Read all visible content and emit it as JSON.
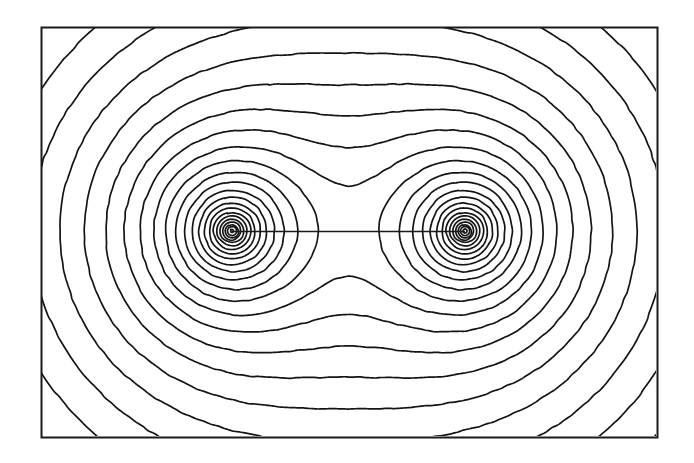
{
  "figure": {
    "domain": "Chart",
    "title": "",
    "caption": "",
    "background_color": "#ffffff",
    "width": 694,
    "height": 463
  },
  "frame": {
    "name": "plot-border",
    "x": 41,
    "y": 27,
    "width": 616,
    "height": 410,
    "stroke_color": "#1a1a1a",
    "stroke_width": 2.0,
    "fill_color": "#ffffff"
  },
  "axis_line": {
    "name": "charge-axis-line",
    "visible": true,
    "y": 231,
    "x_start": 232,
    "x_end": 465,
    "stroke_color": "#1a1a1a",
    "stroke_width": 1.6
  },
  "charges": [
    {
      "label": "left-charge",
      "x": 232,
      "y": 231,
      "sign": 1,
      "magnitude": 1.0
    },
    {
      "label": "right-charge",
      "x": 465,
      "y": 231,
      "sign": 1,
      "magnitude": 1.0
    }
  ],
  "contour_style": {
    "stroke_color": "#141414",
    "stroke_width": 1.7,
    "line_join": "round",
    "line_cap": "round",
    "jitter_amplitude": 0.55,
    "jitter_frequency": 0.13
  },
  "chart_data": {
    "type": "contour",
    "title": "Equipotential lines of two equal like point charges",
    "subtitle": "",
    "xlabel": "",
    "ylabel": "",
    "xlim": [
      41,
      657
    ],
    "ylim": [
      27,
      437
    ],
    "grid": false,
    "legend": "none",
    "axis_ticks": [],
    "tick_labels": [],
    "annotations": [],
    "field": {
      "formula": "V(x,y) = q1 / r1 + q2 / r2",
      "softening": 3.2,
      "sample_step": 1.25,
      "sources": [
        {
          "x": 232,
          "y": 231,
          "q": 1.0
        },
        {
          "x": 465,
          "y": 231,
          "q": 1.0
        }
      ]
    },
    "levels": [
      0.00505,
      0.0057,
      0.00645,
      0.0073,
      0.00828,
      0.0094,
      0.0107,
      0.0122,
      0.01395,
      0.016,
      0.0184,
      0.02125,
      0.02465,
      0.02875,
      0.03375,
      0.0399,
      0.0476,
      0.0574,
      0.0701,
      0.087,
      0.1103,
      0.1435,
      0.194,
      0.276,
      0.425,
      0.75
    ],
    "level_count": 26,
    "level_spacing": "geometric"
  },
  "accessibility": {
    "alt_text": "Contour plot of the electric potential of two equal positive point charges placed on a horizontal line, showing nested closed equipotential loops around each charge and a saddle point midway between them."
  }
}
